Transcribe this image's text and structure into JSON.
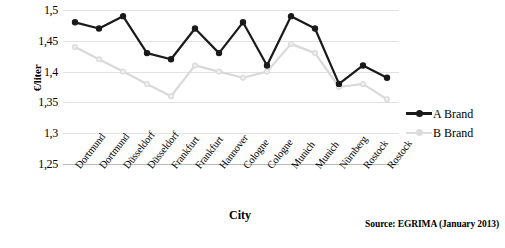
{
  "chart_data": {
    "type": "line",
    "title": "",
    "xlabel": "City",
    "ylabel": "€/liter",
    "ylim": [
      1.25,
      1.5
    ],
    "yticks": [
      1.5,
      1.45,
      1.4,
      1.35,
      1.3,
      1.25
    ],
    "ytick_labels": [
      "1,5",
      "1,45",
      "1,4",
      "1,35",
      "1,3",
      "1,25"
    ],
    "grid": true,
    "legend_position": "right",
    "categories": [
      "Dortmund",
      "Dortmund",
      "Düsseldorf",
      "Düsseldorf",
      "Frankfurt",
      "Frankfurt",
      "Hannover",
      "Cologne",
      "Cologne",
      "Munich",
      "Munich",
      "Nürnberg",
      "Rostock",
      "Rostock"
    ],
    "series": [
      {
        "name": "A Brand",
        "color": "#1a1a1a",
        "values": [
          1.48,
          1.47,
          1.49,
          1.43,
          1.42,
          1.47,
          1.43,
          1.48,
          1.41,
          1.49,
          1.47,
          1.38,
          1.41,
          1.39
        ]
      },
      {
        "name": "B Brand",
        "color": "#d9d9d9",
        "values": [
          1.44,
          1.42,
          1.4,
          1.38,
          1.36,
          1.41,
          1.4,
          1.39,
          1.4,
          1.445,
          1.43,
          1.375,
          1.38,
          1.355
        ]
      }
    ],
    "annotations": [
      "Source: EGRIMA (January 2013)"
    ]
  },
  "source": {
    "text": "Source: EGRIMA (January 2013)"
  },
  "legend": {
    "items": [
      {
        "label": "A Brand"
      },
      {
        "label": "B Brand"
      }
    ]
  }
}
